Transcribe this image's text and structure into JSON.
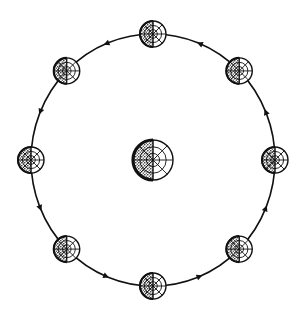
{
  "diagram": {
    "title": "",
    "colors": {
      "ink": "#111111",
      "background": "#ffffff"
    },
    "orbit": {
      "direction": "counterclockwise",
      "arrow_count": 8
    },
    "center_body": {
      "name": "central-globe",
      "shaded_side": "left"
    },
    "orbit_positions": [
      {
        "label": "top",
        "angle_deg": 90,
        "shaded_side": "left"
      },
      {
        "label": "top-right",
        "angle_deg": 45,
        "shaded_side": "left"
      },
      {
        "label": "right",
        "angle_deg": 0,
        "shaded_side": "left"
      },
      {
        "label": "bottom-right",
        "angle_deg": -45,
        "shaded_side": "left"
      },
      {
        "label": "bottom",
        "angle_deg": -90,
        "shaded_side": "left"
      },
      {
        "label": "bottom-left",
        "angle_deg": -135,
        "shaded_side": "left"
      },
      {
        "label": "left",
        "angle_deg": 180,
        "shaded_side": "left"
      },
      {
        "label": "top-left",
        "angle_deg": 135,
        "shaded_side": "left"
      }
    ]
  }
}
